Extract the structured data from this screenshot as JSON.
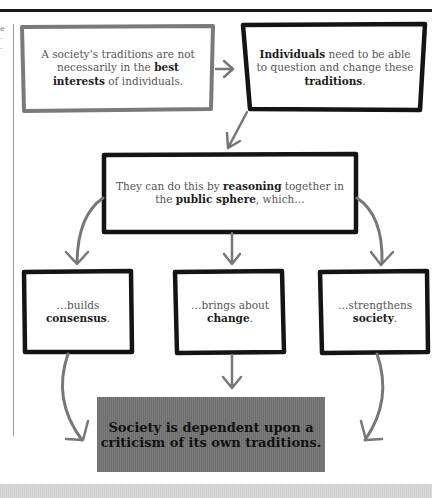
{
  "page": {
    "side_fragment": [
      "e",
      "·",
      "·"
    ]
  },
  "diagram": {
    "box1": {
      "pre": "A society’s traditions are not necessarily in the ",
      "bold1": "best interests",
      "post": " of individuals."
    },
    "box2": {
      "bold1": "Individuals",
      "mid": " need to be able to question and change these ",
      "bold2": "traditions",
      "post": "."
    },
    "box3": {
      "pre": "They can do this by ",
      "bold1": "reasoning",
      "mid": " together in the ",
      "bold2": "public sphere",
      "post": ", which…"
    },
    "box4": {
      "pre": "…builds ",
      "bold1": "consensus",
      "post": "."
    },
    "box5": {
      "pre": "…brings about ",
      "bold1": "change",
      "post": "."
    },
    "box6": {
      "pre": "…strengthens ",
      "bold1": "society",
      "post": "."
    },
    "conclusion": "Society is dependent upon a criticism of its own traditions."
  },
  "colors": {
    "box_border_light": "#7a7a7a",
    "box_border_dark": "#141414",
    "arrow": "#777777",
    "conclusion_bg": "#747474"
  }
}
